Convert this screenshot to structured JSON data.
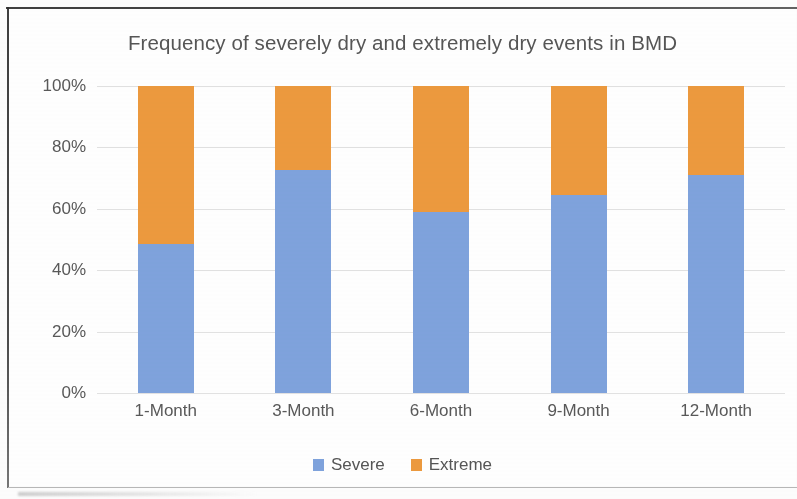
{
  "chart_data": {
    "type": "bar",
    "subtype": "stacked-100-percent",
    "title": "Frequency of severely dry and extremely dry events in BMD",
    "xlabel": "",
    "ylabel": "",
    "ylim": [
      0,
      100
    ],
    "yticks": [
      "0%",
      "20%",
      "40%",
      "60%",
      "80%",
      "100%"
    ],
    "ytick_values": [
      0,
      20,
      40,
      60,
      80,
      100
    ],
    "grid": true,
    "legend_position": "bottom",
    "categories": [
      "1-Month",
      "3-Month",
      "6-Month",
      "9-Month",
      "12-Month"
    ],
    "series": [
      {
        "name": "Severe",
        "color": "#7fa3dd",
        "values": [
          48.5,
          72.5,
          59.0,
          64.5,
          71.0
        ]
      },
      {
        "name": "Extreme",
        "color": "#ed9a3e",
        "values": [
          51.5,
          27.5,
          41.0,
          35.5,
          29.0
        ]
      }
    ]
  },
  "legend": {
    "items": [
      {
        "label": "Severe",
        "color": "#7fa3dd"
      },
      {
        "label": "Extreme",
        "color": "#ed9a3e"
      }
    ]
  },
  "colors": {
    "severe": "#7fa3dd",
    "extreme": "#ed9a3e",
    "gridline": "#e2e2e2",
    "text": "#595959",
    "title_text": "#565656",
    "plot_background": "#ffffff",
    "page_background": "#fdfdfd",
    "frame": "#2e2e2e"
  }
}
